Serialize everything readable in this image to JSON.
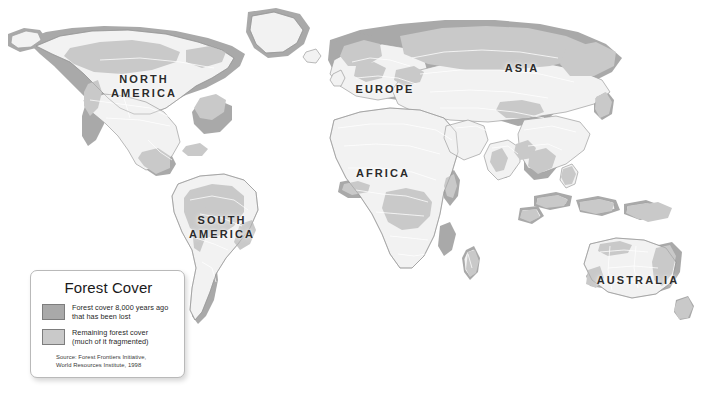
{
  "map": {
    "title": "Forest Cover",
    "background_color": "#ffffff",
    "land_color": "#f2f2f2",
    "lost_forest_color": "#a9a9a9",
    "remaining_forest_color": "#c9c9c9",
    "border_line_color": "#ffffff",
    "coast_line_color": "#9a9a9a",
    "labels": [
      {
        "id": "north-america",
        "text": "NORTH\nAMERICA",
        "x": 108,
        "y": 72
      },
      {
        "id": "south-america",
        "text": "SOUTH\nAMERICA",
        "x": 186,
        "y": 213
      },
      {
        "id": "europe",
        "text": "EUROPE",
        "x": 352,
        "y": 82
      },
      {
        "id": "africa",
        "text": "AFRICA",
        "x": 355,
        "y": 166
      },
      {
        "id": "asia",
        "text": "ASIA",
        "x": 498,
        "y": 61
      },
      {
        "id": "australia",
        "text": "AUSTRALIA",
        "x": 596,
        "y": 273
      }
    ]
  },
  "legend": {
    "title": "Forest Cover",
    "entries": [
      {
        "id": "lost-forest",
        "swatch_color": "#a9a9a9",
        "text": "Forest cover 8,000 years ago\nthat has been lost"
      },
      {
        "id": "remaining-forest",
        "swatch_color": "#c9c9c9",
        "text": "Remaining forest cover\n(much of it fragmented)"
      }
    ],
    "source": "Source:  Forest Frontiers Initiative,\n            World Resources Institute, 1998"
  }
}
